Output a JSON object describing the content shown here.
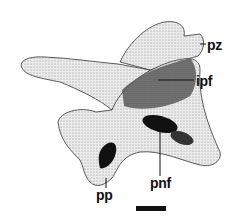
{
  "figure": {
    "labels": [
      {
        "id": "pz",
        "text": "pz"
      },
      {
        "id": "ipf",
        "text": "ipf"
      },
      {
        "id": "pnf",
        "text": "pnf"
      },
      {
        "id": "pp",
        "text": "pp"
      }
    ],
    "scale_bar": {
      "label": ""
    },
    "colors": {
      "ink": "#111111",
      "paper": "#ffffff",
      "bone_light": "#e9e9e9",
      "bone_mid": "#a8a8a8",
      "bone_dark": "#4a4a4a"
    }
  }
}
